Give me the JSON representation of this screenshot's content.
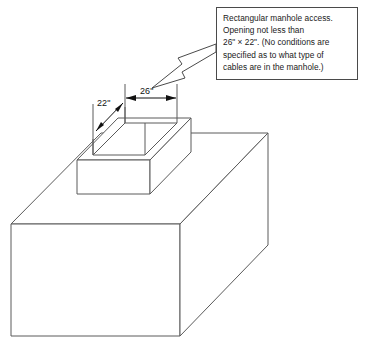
{
  "figure": {
    "background_color": "#ffffff",
    "line_color": "#555555"
  },
  "callout": {
    "name": "manhole-access-note",
    "border_color": "#4a4a4a",
    "lines": [
      "Rectangular manhole access.",
      "Opening not less than",
      "26\" × 22\". (No conditions are",
      "specified as to what type of",
      "cables are in the manhole.)"
    ],
    "full_text": "Rectangular manhole access. Opening not less than 26\" × 22\". (No conditions are specified as to what type of cables are in the manhole.)"
  },
  "leader_arrow": {
    "name": "callout-leader-arrow",
    "style": "hollow-block-arrow",
    "points_to": "manhole-opening",
    "direction": "down-left"
  },
  "dimensions": [
    {
      "id": "width-26",
      "label": "26\"",
      "value": 26,
      "unit": "in",
      "describes": "opening length",
      "orientation": "horizontal"
    },
    {
      "id": "width-22",
      "label": "22\"",
      "value": 22,
      "unit": "in",
      "describes": "opening width",
      "orientation": "diagonal"
    }
  ],
  "objects": {
    "slab": {
      "name": "concrete-slab",
      "description": "Large rectangular slab shown in isometric view"
    },
    "collar": {
      "name": "manhole-collar",
      "description": "Raised rectangular curb around the manhole opening"
    },
    "opening": {
      "name": "manhole-opening",
      "description": "Rectangular open throat of the manhole access"
    }
  }
}
